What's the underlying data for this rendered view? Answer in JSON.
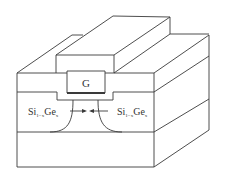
{
  "diagram": {
    "type": "3D MOSFET cross-section with strained SiGe source/drain",
    "gate": {
      "label": "G"
    },
    "source_label": {
      "base": "Si",
      "sub1": "1−x",
      "mid": "Ge",
      "sub2": "x"
    },
    "drain_label": {
      "base": "Si",
      "sub1": "1−x",
      "mid": "Ge",
      "sub2": "x"
    },
    "colors": {
      "line": "#3a3a3a",
      "background": "#ffffff"
    }
  }
}
